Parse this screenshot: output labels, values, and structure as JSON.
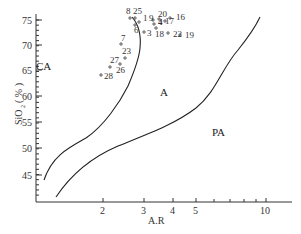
{
  "chart_data": {
    "type": "scatter",
    "title": "",
    "xlabel": "A.R",
    "ylabel": "SiO2 (%)",
    "xscale": "log",
    "xlim": [
      1,
      13
    ],
    "ylim": [
      40,
      76
    ],
    "x_ticks": [
      "2",
      "3",
      "4",
      "5",
      "10"
    ],
    "y_ticks": [
      "45",
      "50",
      "55",
      "60",
      "65",
      "70",
      "75"
    ],
    "regions": [
      {
        "label": "CA",
        "name": "calc-alkaline"
      },
      {
        "label": "A",
        "name": "alkaline"
      },
      {
        "label": "PA",
        "name": "peralkaline"
      }
    ],
    "boundaries": [
      {
        "name": "CA-A boundary",
        "points": [
          [
            1.05,
            44.5
          ],
          [
            1.25,
            48.5
          ],
          [
            1.8,
            52
          ],
          [
            2.2,
            58
          ],
          [
            2.5,
            64
          ],
          [
            2.65,
            69
          ],
          [
            2.6,
            73
          ],
          [
            2.45,
            75.5
          ]
        ]
      },
      {
        "name": "A-PA boundary",
        "points": [
          [
            1.25,
            40.5
          ],
          [
            1.6,
            45
          ],
          [
            2.2,
            49
          ],
          [
            3,
            52
          ],
          [
            4,
            56
          ],
          [
            5,
            61
          ],
          [
            6.5,
            66.5
          ],
          [
            8,
            71
          ],
          [
            10,
            75.5
          ]
        ]
      }
    ],
    "points": [
      {
        "label": "1",
        "x": 2.85,
        "y": 73.8
      },
      {
        "label": "3",
        "x": 3.05,
        "y": 71.8
      },
      {
        "label": "4",
        "x": 3.45,
        "y": 73.2
      },
      {
        "label": "6",
        "x": 2.75,
        "y": 72.8
      },
      {
        "label": "7",
        "x": 2.3,
        "y": 70.2
      },
      {
        "label": "8",
        "x": 2.62,
        "y": 74.0
      },
      {
        "label": "9",
        "x": 3.2,
        "y": 73.8
      },
      {
        "label": "16",
        "x": 4.0,
        "y": 74.2
      },
      {
        "label": "17",
        "x": 3.6,
        "y": 73.5
      },
      {
        "label": "18",
        "x": 3.4,
        "y": 72.0
      },
      {
        "label": "19",
        "x": 4.4,
        "y": 71.5
      },
      {
        "label": "20",
        "x": 3.45,
        "y": 74.5
      },
      {
        "label": "22",
        "x": 3.95,
        "y": 71.8
      },
      {
        "label": "23",
        "x": 2.4,
        "y": 67.3
      },
      {
        "label": "25",
        "x": 2.7,
        "y": 74.2
      },
      {
        "label": "26",
        "x": 2.15,
        "y": 65.8
      },
      {
        "label": "27",
        "x": 2.2,
        "y": 66.5
      },
      {
        "label": "28",
        "x": 1.95,
        "y": 64.0
      }
    ],
    "grid": false,
    "legend": "none"
  },
  "axes": {
    "x_label": "A.R",
    "y_label_main": "SiO",
    "y_label_sub": "2",
    "y_label_unit": "( % )",
    "x_ticks": [
      {
        "label": "2",
        "x": 103
      },
      {
        "label": "3",
        "x": 144
      },
      {
        "label": "4",
        "x": 173
      },
      {
        "label": "5",
        "x": 196
      },
      {
        "label": "10",
        "x": 266
      }
    ],
    "y_ticks": [
      {
        "label": "75",
        "y": 20
      },
      {
        "label": "70",
        "y": 45
      },
      {
        "label": "65",
        "y": 70
      },
      {
        "label": "60",
        "y": 96
      },
      {
        "label": "55",
        "y": 122
      },
      {
        "label": "50",
        "y": 148
      },
      {
        "label": "45",
        "y": 175
      }
    ]
  },
  "regions": {
    "ca": "CA",
    "a": "A",
    "pa": "PA"
  }
}
